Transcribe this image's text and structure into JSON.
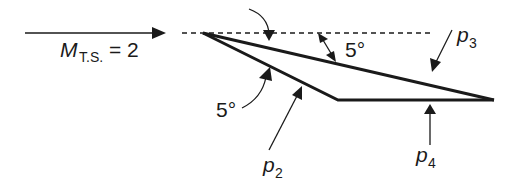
{
  "diagram": {
    "type": "supersonic airfoil / wedge flow schematic",
    "freestream": {
      "symbol": "M",
      "subscript": "T.S.",
      "equals": "= 2"
    },
    "angles": {
      "upper_angle": "5°",
      "lower_angle": "5°"
    },
    "pressures": {
      "p2": {
        "symbol": "p",
        "subscript": "2"
      },
      "p3": {
        "symbol": "p",
        "subscript": "3"
      },
      "p4": {
        "symbol": "p",
        "subscript": "4"
      }
    },
    "colors": {
      "ink": "#1a1a1a",
      "background": "#ffffff"
    }
  }
}
